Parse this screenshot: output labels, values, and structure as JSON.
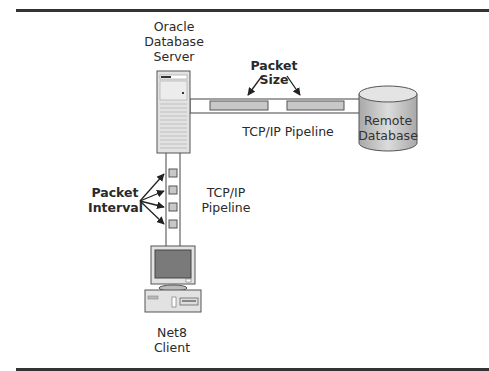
{
  "diagram": {
    "server": {
      "label_lines": [
        "Oracle",
        "Database",
        "Server"
      ]
    },
    "remote_db": {
      "label_lines": [
        "Remote",
        "Database"
      ]
    },
    "client": {
      "label_lines": [
        "Net8",
        "Client"
      ]
    },
    "horizontal_pipeline": {
      "label": "TCP/IP Pipeline",
      "packet_count": 2
    },
    "vertical_pipeline": {
      "label_lines": [
        "TCP/IP",
        "Pipeline"
      ],
      "packet_count": 4
    },
    "packet_size": {
      "label_lines": [
        "Packet",
        "Size"
      ]
    },
    "packet_interval": {
      "label_lines": [
        "Packet",
        "Interval"
      ]
    },
    "colors": {
      "rule": "#333333",
      "packet_fill": "#c8c8c8",
      "device_fill": "#e2e2e2",
      "screen_fill": "#7a7a7a",
      "outline": "#444444"
    }
  }
}
